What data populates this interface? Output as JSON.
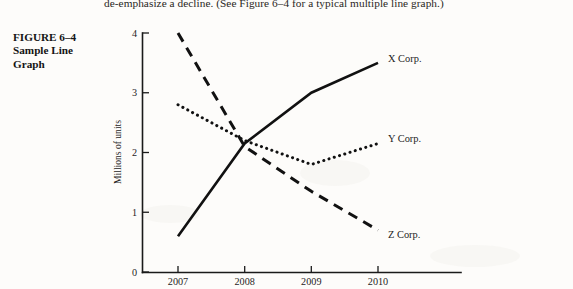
{
  "page": {
    "running_text": "de-emphasize a decline. (See Figure 6–4 for a typical multiple line graph.)",
    "background_color": "#fdfcfa",
    "ink_color": "#111111"
  },
  "figure_caption": {
    "number": "FIGURE 6–4",
    "title": "Sample Line Graph"
  },
  "chart_data": {
    "type": "line",
    "title": "Sample Line Graph",
    "xlabel": "",
    "ylabel": "Millions of units",
    "categories": [
      "2007",
      "2008",
      "2009",
      "2010"
    ],
    "x_tick_labels": [
      "2007",
      "2008",
      "2009",
      "2010"
    ],
    "y_tick_labels": [
      "0",
      "1",
      "2",
      "3",
      "4"
    ],
    "y_ticks": [
      0,
      1,
      2,
      3,
      4
    ],
    "ylim": [
      0,
      4
    ],
    "xlim": [
      "2007",
      "2010"
    ],
    "grid": false,
    "legend_position": "right-of-line-ends",
    "series": [
      {
        "name": "X Corp.",
        "label": "X Corp.",
        "style": "solid",
        "color": "#111111",
        "values": [
          0.6,
          2.15,
          3.0,
          3.5
        ]
      },
      {
        "name": "Y Corp.",
        "label": "Y Corp.",
        "style": "dotted",
        "color": "#111111",
        "values": [
          2.8,
          2.2,
          1.8,
          2.15
        ]
      },
      {
        "name": "Z Corp.",
        "label": "Z Corp.",
        "style": "dashed",
        "color": "#111111",
        "values": [
          4.0,
          2.1,
          1.35,
          0.7
        ]
      }
    ]
  }
}
